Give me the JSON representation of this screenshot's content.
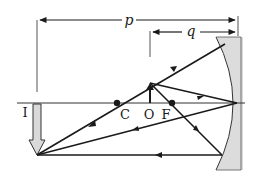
{
  "diagram": {
    "labels": {
      "p": "p",
      "q": "q",
      "image": "I",
      "center": "C",
      "object": "O",
      "focus": "F"
    },
    "colors": {
      "line": "#1a1a1a",
      "mirror_fill": "#dcdcdc",
      "image_fill": "#d9d9d9",
      "guide": "#555555"
    }
  }
}
